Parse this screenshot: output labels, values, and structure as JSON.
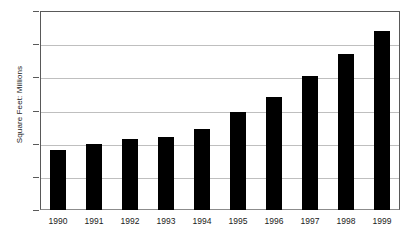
{
  "chart_data": {
    "type": "bar",
    "title": "",
    "subtitle": "",
    "xlabel": "",
    "ylabel": "Square Feet: Millions",
    "categories": [
      "1990",
      "1991",
      "1992",
      "1993",
      "1994",
      "1995",
      "1996",
      "1997",
      "1998",
      "1999"
    ],
    "values": [
      5.36,
      5.4,
      5.43,
      5.44,
      5.49,
      5.59,
      5.68,
      5.81,
      5.94,
      6.08
    ],
    "series": [
      {
        "name": "Square Feet: Millions",
        "values": [
          5.36,
          5.4,
          5.43,
          5.44,
          5.49,
          5.59,
          5.68,
          5.81,
          5.94,
          6.08
        ]
      }
    ],
    "ylim": [
      5.0,
      6.2
    ],
    "ytick_values": [
      5.0,
      5.2,
      5.4,
      5.6,
      5.8,
      6.0,
      6.2
    ],
    "ytick_labels": [
      "5.0",
      "5.2",
      "5.4",
      "5.6",
      "5.8",
      "6.0",
      "6.2"
    ],
    "grid": true,
    "grid_axis": "y",
    "legend": false,
    "legend_position": "none",
    "annotations": [],
    "colors": {
      "bar": "#000000",
      "gridline": "#bfbfbf",
      "frame": "#595959",
      "axis_baseline": "#8c8c8c",
      "background": "#ffffff",
      "text": "#1a1a1a"
    }
  }
}
